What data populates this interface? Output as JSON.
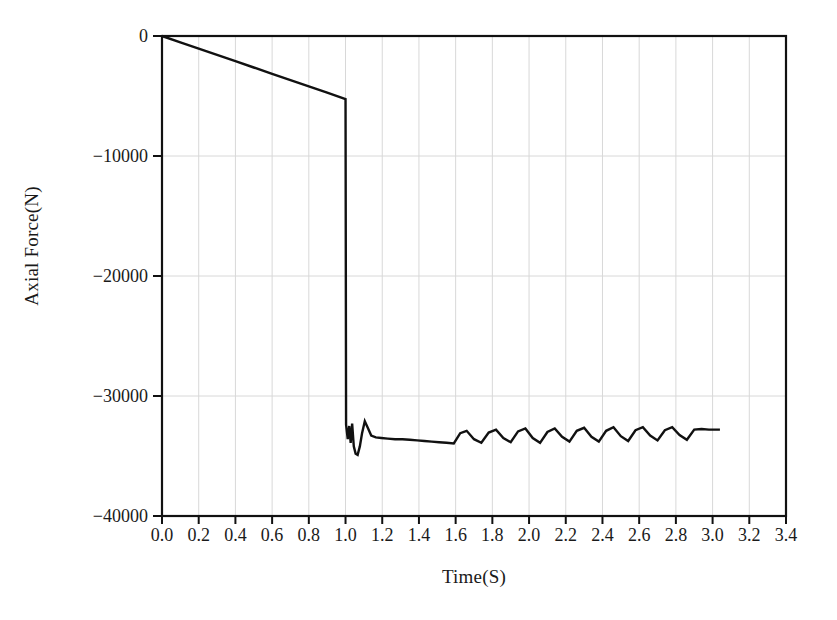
{
  "chart_data": {
    "type": "line",
    "title": "",
    "xlabel": "Time(S)",
    "ylabel": "Axial Force(N)",
    "xlim": [
      0.0,
      3.4
    ],
    "ylim": [
      -40000,
      0
    ],
    "xticks": [
      "0.0",
      "0.2",
      "0.4",
      "0.6",
      "0.8",
      "1.0",
      "1.2",
      "1.4",
      "1.6",
      "1.8",
      "2.0",
      "2.2",
      "2.4",
      "2.6",
      "2.8",
      "3.0",
      "3.2",
      "3.4"
    ],
    "xtick_values": [
      0.0,
      0.2,
      0.4,
      0.6,
      0.8,
      1.0,
      1.2,
      1.4,
      1.6,
      1.8,
      2.0,
      2.2,
      2.4,
      2.6,
      2.8,
      3.0,
      3.2,
      3.4
    ],
    "yticks": [
      "0",
      "−10000",
      "−20000",
      "−30000",
      "−40000"
    ],
    "ytick_values": [
      0,
      -10000,
      -20000,
      -30000,
      -40000
    ],
    "grid": true,
    "grid_color": "#d8d8d8",
    "line_color": "#111111",
    "line_width": 2.4,
    "legend": null,
    "series": [
      {
        "name": "Axial Force",
        "x": [
          0.0,
          0.1,
          0.2,
          0.3,
          0.4,
          0.5,
          0.6,
          0.7,
          0.8,
          0.9,
          1.0,
          1.003,
          1.012,
          1.02,
          1.028,
          1.036,
          1.045,
          1.055,
          1.066,
          1.078,
          1.09,
          1.105,
          1.12,
          1.14,
          1.165,
          1.195,
          1.23,
          1.27,
          1.31,
          1.35,
          1.39,
          1.43,
          1.47,
          1.51,
          1.55,
          1.59,
          1.625,
          1.66,
          1.7,
          1.74,
          1.78,
          1.82,
          1.86,
          1.9,
          1.94,
          1.98,
          2.02,
          2.06,
          2.1,
          2.14,
          2.18,
          2.22,
          2.26,
          2.3,
          2.34,
          2.38,
          2.42,
          2.46,
          2.5,
          2.54,
          2.58,
          2.62,
          2.66,
          2.7,
          2.74,
          2.78,
          2.82,
          2.86,
          2.9,
          2.94,
          2.98,
          3.04
        ],
        "y": [
          0,
          -525,
          -1050,
          -1575,
          -2100,
          -2625,
          -3150,
          -3675,
          -4200,
          -4725,
          -5250,
          -32400,
          -33600,
          -32500,
          -33900,
          -32300,
          -34200,
          -34800,
          -34900,
          -34200,
          -33100,
          -32100,
          -32600,
          -33300,
          -33450,
          -33500,
          -33550,
          -33600,
          -33600,
          -33650,
          -33700,
          -33750,
          -33800,
          -33850,
          -33900,
          -33950,
          -33100,
          -32900,
          -33600,
          -33900,
          -33050,
          -32800,
          -33500,
          -33850,
          -32950,
          -32700,
          -33500,
          -33900,
          -33000,
          -32700,
          -33400,
          -33800,
          -32900,
          -32650,
          -33400,
          -33800,
          -32900,
          -32600,
          -33350,
          -33750,
          -32850,
          -32600,
          -33300,
          -33700,
          -32850,
          -32600,
          -33250,
          -33650,
          -32800,
          -32750,
          -32800,
          -32800
        ]
      }
    ]
  },
  "figure": {
    "background": "#ffffff",
    "frame_color": "#111111",
    "axis_label_font_size": "19px",
    "tick_label_font_size": "18px"
  }
}
